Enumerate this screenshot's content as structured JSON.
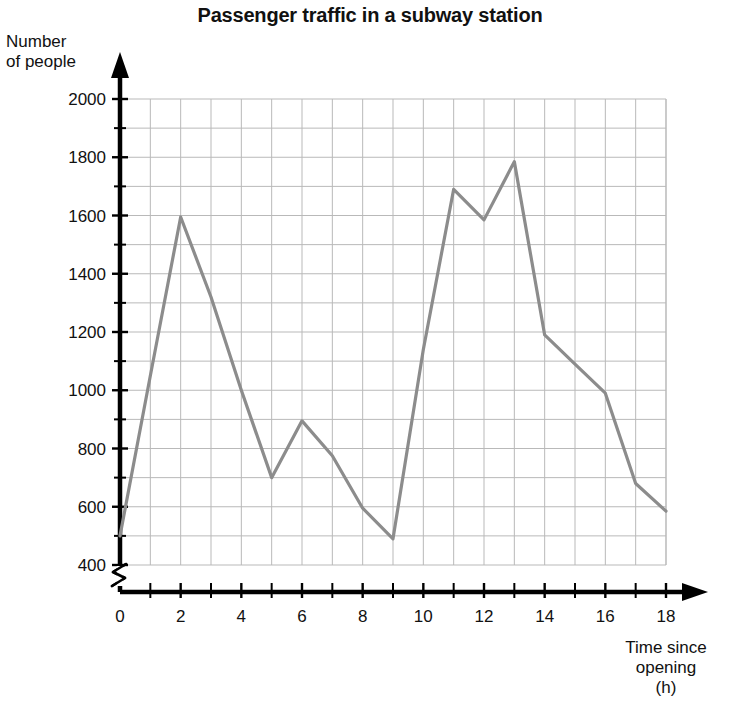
{
  "chart_data": {
    "type": "line",
    "title": "Passenger traffic in a subway station",
    "xlabel": "Time since opening (h)",
    "ylabel": "Number of people",
    "xlabel_lines": [
      "Time since",
      "opening",
      "(h)"
    ],
    "ylabel_lines": [
      "Number",
      "of people"
    ],
    "x": [
      0,
      1,
      2,
      3,
      4,
      5,
      6,
      7,
      8,
      9,
      10,
      11,
      12,
      13,
      14,
      15,
      16,
      17,
      18
    ],
    "values": [
      500,
      1050,
      1595,
      1320,
      1000,
      700,
      895,
      775,
      595,
      490,
      1140,
      1690,
      1585,
      1785,
      1190,
      1090,
      990,
      680,
      585
    ],
    "xlim": [
      0,
      18
    ],
    "ylim": [
      400,
      2000
    ],
    "y_axis_break": true,
    "y_break_label": "0",
    "xticks": [
      0,
      1,
      2,
      3,
      4,
      5,
      6,
      7,
      8,
      9,
      10,
      11,
      12,
      13,
      14,
      15,
      16,
      17,
      18
    ],
    "xtick_labels": [
      "0",
      "",
      "2",
      "",
      "4",
      "",
      "6",
      "",
      "8",
      "",
      "10",
      "",
      "12",
      "",
      "14",
      "",
      "16",
      "",
      "18"
    ],
    "yticks": [
      400,
      500,
      600,
      700,
      800,
      900,
      1000,
      1100,
      1200,
      1300,
      1400,
      1500,
      1600,
      1700,
      1800,
      1900,
      2000
    ],
    "ytick_labels": [
      "400",
      "",
      "600",
      "",
      "800",
      "",
      "1000",
      "",
      "1200",
      "",
      "1400",
      "",
      "1600",
      "",
      "1800",
      "",
      "2000"
    ],
    "grid": true,
    "legend": false,
    "line_color": "#8c8c8c",
    "grid_color": "#b9b9b9",
    "axis_color": "#000000"
  }
}
